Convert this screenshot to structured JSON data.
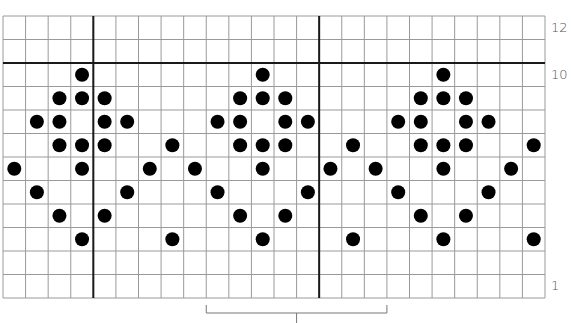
{
  "chart_data": {
    "type": "heatmap",
    "title": "",
    "grid": {
      "columns": 24,
      "rows": 12,
      "row_numbering": "bottom-to-top",
      "thick_vertical_after_columns": [
        4,
        14
      ],
      "thick_horizontal_between_rows": [
        11,
        10
      ]
    },
    "row_labels": [
      {
        "row": 12,
        "text": "12"
      },
      {
        "row": 10,
        "text": "10"
      },
      {
        "row": 1,
        "text": "1"
      }
    ],
    "dots": [
      {
        "row": 10,
        "cols": [
          3,
          11,
          19
        ]
      },
      {
        "row": 9,
        "cols": [
          2,
          3,
          4,
          10,
          11,
          12,
          18,
          19,
          20
        ]
      },
      {
        "row": 8,
        "cols": [
          1,
          2,
          4,
          5,
          9,
          10,
          12,
          13,
          17,
          18,
          20,
          21
        ]
      },
      {
        "row": 7,
        "cols": [
          2,
          3,
          4,
          7,
          10,
          11,
          12,
          15,
          18,
          19,
          20,
          23
        ]
      },
      {
        "row": 6,
        "cols": [
          0,
          3,
          6,
          8,
          11,
          14,
          16,
          19,
          22
        ]
      },
      {
        "row": 5,
        "cols": [
          1,
          5,
          9,
          13,
          17,
          21
        ]
      },
      {
        "row": 4,
        "cols": [
          2,
          4,
          10,
          12,
          18,
          20
        ]
      },
      {
        "row": 3,
        "cols": [
          3,
          7,
          11,
          15,
          19,
          23
        ]
      },
      {
        "row": 2,
        "cols": []
      },
      {
        "row": 1,
        "cols": []
      }
    ],
    "repeat_bracket": {
      "start_col": 9,
      "end_col": 17,
      "label": ""
    },
    "legend": []
  },
  "style": {
    "line_color": "#9a9a9a",
    "thick_line_color": "#1a1a1a",
    "dot_color": "#000000",
    "label_color": "#555555"
  }
}
